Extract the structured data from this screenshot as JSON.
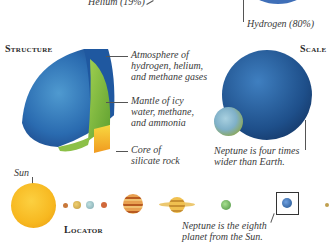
{
  "composition": {
    "helium_label": "Helium (19%)",
    "hydrogen_label": "Hydrogen (80%)",
    "pie_color": "#3f6fb8"
  },
  "structure": {
    "heading": "Structure",
    "layers": [
      {
        "name": "atmosphere",
        "lines": [
          "Atmosphere of",
          "hydrogen, helium,",
          "and methane gases"
        ],
        "color": "#2a6bb0"
      },
      {
        "name": "mantle",
        "lines": [
          "Mantle of icy",
          "water, methane,",
          "and ammonia"
        ],
        "color": "#7fc040"
      },
      {
        "name": "core",
        "lines": [
          "Core of",
          "silicate rock"
        ],
        "color": "#f5c030"
      }
    ]
  },
  "scale": {
    "heading": "Scale",
    "caption_lines": [
      "Neptune is four times",
      "wider than Earth."
    ],
    "neptune_color": "#1e4f8a",
    "earth_color": "#7fb0c8"
  },
  "locator": {
    "heading": "Locator",
    "sun_label": "Sun",
    "caption_lines": [
      "Neptune is the eighth",
      "planet from the Sun."
    ],
    "bodies": [
      {
        "name": "sun",
        "color": "#f7b820"
      },
      {
        "name": "mercury",
        "color": "#c8783a"
      },
      {
        "name": "venus",
        "color": "#d8b050"
      },
      {
        "name": "earth",
        "color": "#8fb8c0"
      },
      {
        "name": "mars",
        "color": "#d0683a"
      },
      {
        "name": "jupiter",
        "color": "#d88a40"
      },
      {
        "name": "saturn",
        "color": "#e0b040"
      },
      {
        "name": "uranus",
        "color": "#6cb050"
      },
      {
        "name": "neptune",
        "color": "#2a5aa8"
      },
      {
        "name": "pluto",
        "color": "#c0a050"
      }
    ]
  }
}
